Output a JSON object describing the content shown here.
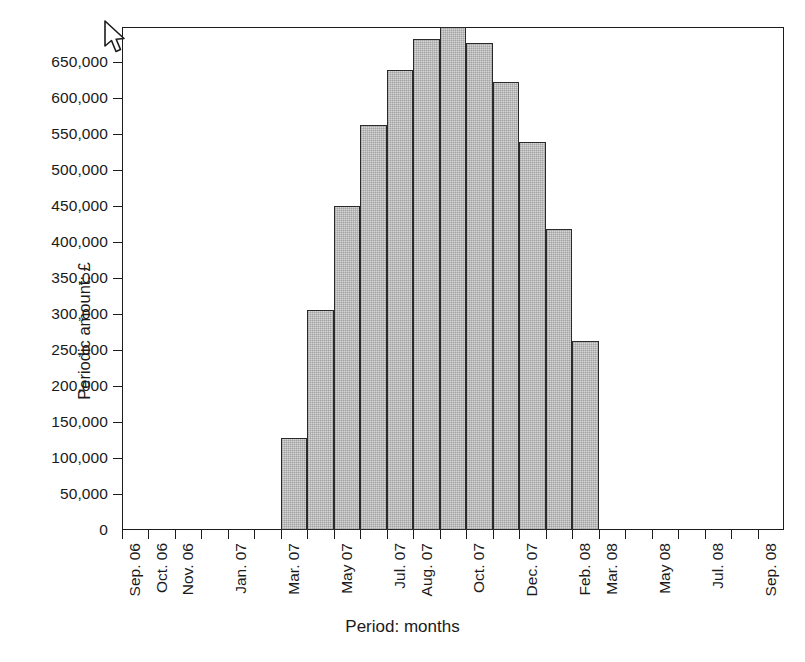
{
  "chart_data": {
    "type": "bar",
    "title": "",
    "xlabel": "Period: months",
    "ylabel": "Periodic amount: £",
    "ylim": [
      0,
      698000
    ],
    "grid": false,
    "legend": false,
    "y_ticks": [
      {
        "value": 0,
        "label": "0"
      },
      {
        "value": 50000,
        "label": "50,000"
      },
      {
        "value": 100000,
        "label": "100,000"
      },
      {
        "value": 150000,
        "label": "150,000"
      },
      {
        "value": 200000,
        "label": "200,000"
      },
      {
        "value": 250000,
        "label": "250,000"
      },
      {
        "value": 300000,
        "label": "300,000"
      },
      {
        "value": 350000,
        "label": "350,000"
      },
      {
        "value": 400000,
        "label": "400,000"
      },
      {
        "value": 450000,
        "label": "450,000"
      },
      {
        "value": 500000,
        "label": "500,000"
      },
      {
        "value": 550000,
        "label": "550,000"
      },
      {
        "value": 600000,
        "label": "600,000"
      },
      {
        "value": 650000,
        "label": "650,000"
      }
    ],
    "x_tick_labels": [
      "Sep. 06",
      "Oct. 06",
      "Nov. 06",
      "Dec. 06",
      "Jan. 07",
      "Feb. 07",
      "Mar. 07",
      "Apr. 07",
      "May 07",
      "Jun. 07",
      "Jul. 07",
      "Aug. 07",
      "Sep. 07",
      "Oct. 07",
      "Nov. 07",
      "Dec. 07",
      "Jan. 08",
      "Feb. 08",
      "Mar. 08",
      "Apr. 08",
      "May 08",
      "Jun. 08",
      "Jul. 08",
      "Aug. 08",
      "Sep. 08"
    ],
    "x_tick_labels_shown": [
      "Sep. 06",
      "Oct. 06",
      "Nov. 06",
      "Jan. 07",
      "Mar. 07",
      "May 07",
      "Jul. 07",
      "Aug. 07",
      "Oct. 07",
      "Dec. 07",
      "Feb. 08",
      "Mar. 08",
      "May 08",
      "Jul. 08",
      "Sep. 08"
    ],
    "categories": [
      "Mar. 07",
      "May 07",
      "Jun. 07",
      "Jul. 07",
      "Aug. 07",
      "Sep. 07",
      "Oct. 07",
      "Nov. 07",
      "Dec. 07",
      "Jan. 08",
      "Feb. 08",
      "Mar. 08",
      "Apr. 08"
    ],
    "values": [
      128000,
      305000,
      450000,
      562000,
      639000,
      682000,
      698000,
      676000,
      621000,
      538000,
      417000,
      262000,
      0
    ]
  },
  "cursor": {
    "icon": "mouse-pointer-icon"
  }
}
